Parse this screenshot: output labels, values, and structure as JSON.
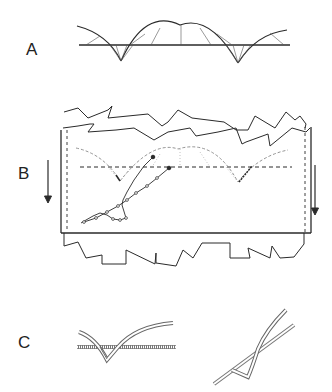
{
  "panels": [
    {
      "id": "A",
      "label": "A",
      "description": "Arches over a horizontal baseline with cusps below"
    },
    {
      "id": "B",
      "label": "B",
      "description": "Arch pattern between jagged boundaries with downward arrows on both sides"
    },
    {
      "id": "C",
      "label": "C",
      "description": "Two detail sketches of crossing double-line structures"
    }
  ],
  "colors": {
    "ink": "#2a2a2a",
    "light_ink": "#8a8a8a",
    "background": "#ffffff"
  }
}
